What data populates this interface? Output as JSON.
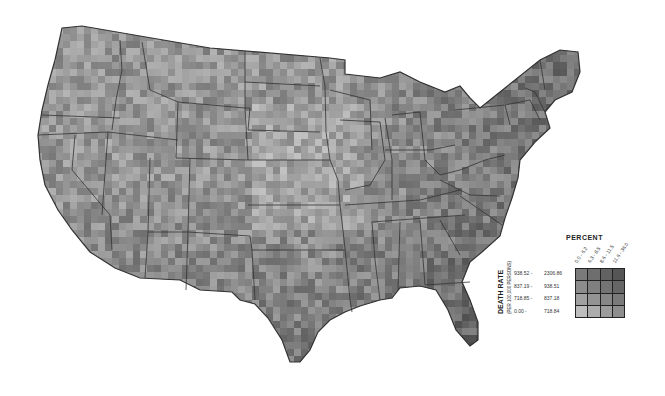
{
  "map": {
    "subject": "United States county death rates",
    "shading": "grayscale bivariate choropleth",
    "border_color": "#333333"
  },
  "legend": {
    "percent_title": "PERCENT",
    "percent_classes": [
      "0.0 - 6.2",
      "6.3 - 8.5",
      "8.6 - 11.5",
      "11.6 - 36.0"
    ],
    "rate_title": "DEATH RATE",
    "rate_subtitle": "(PER 100,000 PERSONS)",
    "rate_classes": [
      {
        "low": "938.52 -",
        "high": "2306.86"
      },
      {
        "low": "837.19 -",
        "high": "938.51"
      },
      {
        "low": "718.85 -",
        "high": "837.18"
      },
      {
        "low": "0.00 -",
        "high": "718.84"
      }
    ],
    "cell_colors": [
      [
        "#7a7a7a",
        "#6e6e6e",
        "#626262",
        "#555555"
      ],
      [
        "#8c8c8c",
        "#808080",
        "#747474",
        "#666666"
      ],
      [
        "#a0a0a0",
        "#939393",
        "#878787",
        "#7a7a7a"
      ],
      [
        "#bdbdbd",
        "#acacac",
        "#9c9c9c",
        "#8e8e8e"
      ]
    ]
  }
}
